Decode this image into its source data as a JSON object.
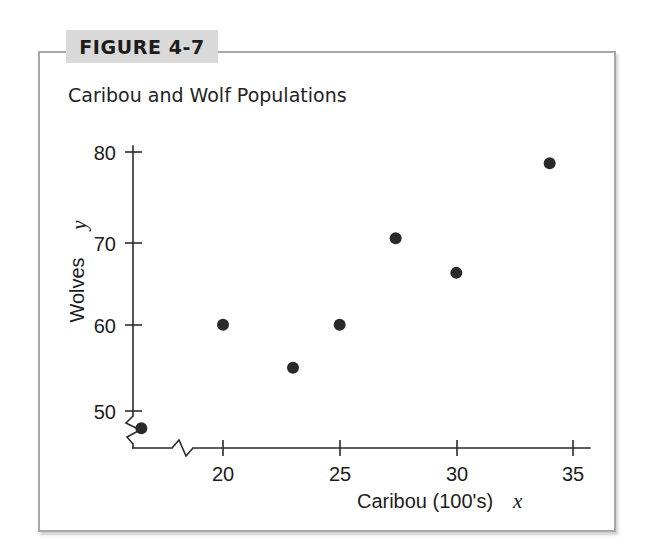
{
  "figure": {
    "tag_label": "FIGURE 4-7",
    "tag_bg": "#d9d9d9",
    "frame_border_color": "#a8a8a8",
    "background": "#ffffff"
  },
  "chart_data": {
    "type": "scatter",
    "title": "Caribou and Wolf Populations",
    "xlabel": "Caribou (100's)",
    "xvar": "x",
    "ylabel": "Wolves",
    "yvar": "y",
    "xlim": [
      15,
      36
    ],
    "ylim": [
      46,
      82
    ],
    "x_ticks": [
      20,
      25,
      30,
      35
    ],
    "x_tick_labels": [
      "20",
      "25",
      "30",
      "35"
    ],
    "y_ticks": [
      50,
      60,
      70,
      80
    ],
    "y_tick_labels": [
      "50",
      "60",
      "70",
      "80"
    ],
    "axis_break_x": true,
    "axis_break_y": true,
    "grid": false,
    "legend": null,
    "marker": "filled-circle",
    "marker_color": "#2a2a2a",
    "points": [
      {
        "x": 16.5,
        "y": 48
      },
      {
        "x": 20.0,
        "y": 60
      },
      {
        "x": 23.0,
        "y": 55
      },
      {
        "x": 25.0,
        "y": 60
      },
      {
        "x": 27.4,
        "y": 70
      },
      {
        "x": 30.0,
        "y": 66
      },
      {
        "x": 34.0,
        "y": 78.7
      }
    ]
  }
}
